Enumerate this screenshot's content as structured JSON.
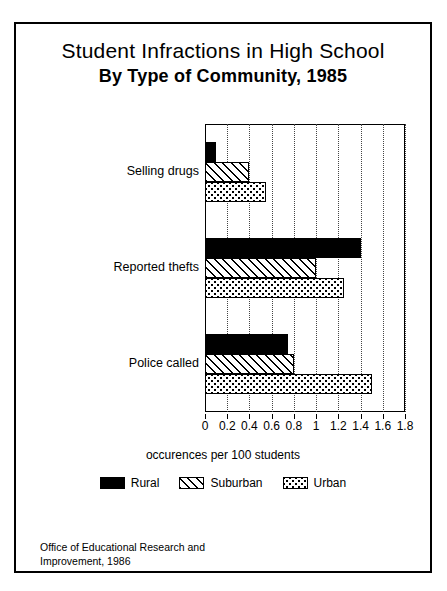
{
  "title": {
    "line1": "Student Infractions in High School",
    "line2": "By Type of Community, 1985"
  },
  "axis_caption": "occurences per 100 students",
  "footnote": "Office of Educational Research and\nImprovement, 1986",
  "legend": {
    "items": [
      {
        "label": "Rural",
        "pattern": "solid-black",
        "color": "#000000"
      },
      {
        "label": "Suburban",
        "pattern": "diagonal-hatch",
        "color": "#000000"
      },
      {
        "label": "Urban",
        "pattern": "dotted-stipple",
        "color": "#000000"
      }
    ]
  },
  "chart_data": {
    "type": "bar",
    "orientation": "horizontal",
    "title": "Student Infractions in High School By Type of Community, 1985",
    "xlabel": "occurences per 100 students",
    "ylabel": "",
    "categories": [
      "Selling drugs",
      "Reported thefts",
      "Police called"
    ],
    "series": [
      {
        "name": "Rural",
        "values": [
          0.1,
          1.4,
          0.75
        ]
      },
      {
        "name": "Suburban",
        "values": [
          0.4,
          1.0,
          0.8
        ]
      },
      {
        "name": "Urban",
        "values": [
          0.55,
          1.25,
          1.5
        ]
      }
    ],
    "xlim": [
      0,
      1.8
    ],
    "xticks": [
      0,
      0.2,
      0.4,
      0.6,
      0.8,
      1,
      1.2,
      1.4,
      1.6,
      1.8
    ],
    "xtick_labels": [
      "0",
      "0.2",
      "0.4",
      "0.6",
      "0.8",
      "1",
      "1.2",
      "1.4",
      "1.6",
      "1.8"
    ],
    "grid": true,
    "grid_axis": "x",
    "legend_position": "bottom"
  }
}
